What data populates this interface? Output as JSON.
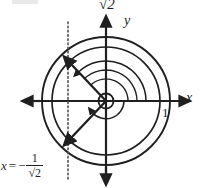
{
  "figure": {
    "type": "unit-circle-diagram",
    "title": "",
    "labels": {
      "outer_radius": "√2",
      "y_axis": "y",
      "x_axis": "x",
      "unit_tick": "1",
      "equation_var": "x",
      "equation_eq": "=",
      "equation_minus": "−",
      "equation_numerator": "1",
      "equation_denominator": "√2"
    },
    "geometry": {
      "center_x": 106,
      "center_y": 101,
      "inner_radius": 54,
      "outer_radius": 64,
      "dotted_line_x": 68,
      "vector_angles_deg": [
        135,
        225
      ],
      "axis_color": "#1f1f1f",
      "circle_color": "#1f1f1f",
      "dotted_color": "#5a5a5a"
    }
  }
}
